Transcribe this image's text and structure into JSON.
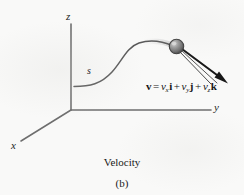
{
  "figure": {
    "caption_title": "Velocity",
    "part_label": "(b)",
    "axes": {
      "x_label": "x",
      "y_label": "y",
      "z_label": "z"
    },
    "path_label": "s",
    "equation": {
      "lhs": "v",
      "equals": "=",
      "term1_coefficient": "v",
      "term1_subscript": "x",
      "term1_unit": "i",
      "plus1": "+",
      "term2_coefficient": "v",
      "term2_subscript": "y",
      "term2_unit": "j",
      "plus2": "+",
      "term3_coefficient": "v",
      "term3_subscript": "z",
      "term3_unit": "k"
    },
    "colors": {
      "background": "#f9f9f8",
      "ink": "#1c1c1c",
      "axis": "#6e6e6e",
      "curve": "#5a5a5a",
      "arrow": "#181818",
      "particle_fill": "#8a8a8a",
      "particle_edge": "#3a3a3a",
      "particle_highlight": "#d8d8d8"
    }
  }
}
